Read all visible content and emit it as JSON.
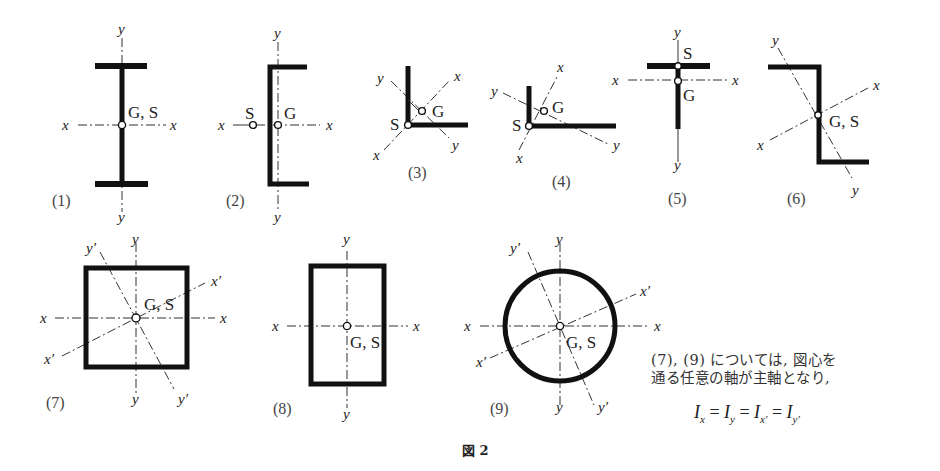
{
  "figure": {
    "caption": "図 2",
    "panels": [
      {
        "id": "1",
        "label": "(1)",
        "shape": "I-section",
        "points": "G, S",
        "axes": [
          "x",
          "x",
          "y",
          "y"
        ]
      },
      {
        "id": "2",
        "label": "(2)",
        "shape": "channel-section",
        "points": [
          "S",
          "G"
        ],
        "axes": [
          "x",
          "x",
          "y",
          "y"
        ]
      },
      {
        "id": "3",
        "label": "(3)",
        "shape": "equal-angle",
        "points": [
          "S",
          "G"
        ],
        "axes": [
          "x",
          "x",
          "y",
          "y"
        ]
      },
      {
        "id": "4",
        "label": "(4)",
        "shape": "unequal-angle",
        "points": [
          "S",
          "G"
        ],
        "axes": [
          "x",
          "x",
          "y",
          "y"
        ]
      },
      {
        "id": "5",
        "label": "(5)",
        "shape": "T-section",
        "points": [
          "S",
          "G"
        ],
        "axes": [
          "x",
          "x",
          "y",
          "y"
        ]
      },
      {
        "id": "6",
        "label": "(6)",
        "shape": "Z-section",
        "points": "G, S",
        "axes": [
          "x",
          "x",
          "y",
          "y"
        ]
      },
      {
        "id": "7",
        "label": "(7)",
        "shape": "square-tube",
        "points": "G, S",
        "axes": [
          "x",
          "x",
          "y",
          "y",
          "x'",
          "x'",
          "y'",
          "y'"
        ]
      },
      {
        "id": "8",
        "label": "(8)",
        "shape": "rectangular-tube",
        "points": "G, S",
        "axes": [
          "x",
          "x",
          "y",
          "y"
        ]
      },
      {
        "id": "9",
        "label": "(9)",
        "shape": "circular-tube",
        "points": "G, S",
        "axes": [
          "x",
          "x",
          "y",
          "y",
          "x'",
          "x'",
          "y'",
          "y'"
        ]
      }
    ],
    "labels": {
      "x": "x",
      "y": "y",
      "xp": "x′",
      "yp": "y′",
      "G": "G",
      "S": "S",
      "GS": "G, S",
      "p1": "(1)",
      "p2": "(2)",
      "p3": "(3)",
      "p4": "(4)",
      "p5": "(5)",
      "p6": "(6)",
      "p7": "(7)",
      "p8": "(8)",
      "p9": "(9)"
    },
    "note": {
      "line1": "(7), (9) については, 図心を",
      "line2": "通る任意の軸が主軸となり,",
      "equation": {
        "I": "I",
        "subs": [
          "x",
          "y",
          "x′",
          "y′"
        ],
        "eq": "="
      }
    }
  }
}
